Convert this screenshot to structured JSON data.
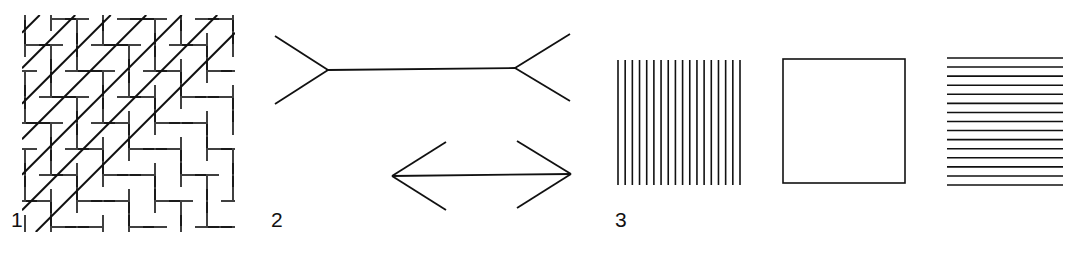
{
  "plate": {
    "width": 1074,
    "height": 279,
    "background_color": "#ffffff",
    "ink_color": "#111111"
  },
  "figures": [
    {
      "id": "zollner",
      "label": "1",
      "title": "Zollner illusion",
      "description": "Square field of parallel diagonal lines crossed by short herringbone hatch strokes",
      "geometry": {
        "box": {
          "x": 22,
          "y": 15,
          "width": 213,
          "height": 217
        },
        "main_line_count": 6,
        "main_line_angle_deg": -45,
        "main_line_width": 2.0,
        "hatch_stroke_width": 1.6,
        "hatch_length": 24,
        "hatch_row_spacing": 13,
        "hatch_angle_a_deg": 90,
        "hatch_angle_b_deg": 0
      }
    },
    {
      "id": "muller-lyer",
      "label": "2",
      "title": "Muller-Lyer illusion",
      "description": "Two equal horizontal shafts, one with outward fins and one with inward arrowheads",
      "geometry": {
        "stroke_width": 1.8,
        "outward": {
          "shaft": {
            "x1": 328,
            "y1": 70,
            "x2": 515,
            "y2": 68
          },
          "fins": [
            {
              "x1": 328,
              "y1": 70,
              "x2": 275,
              "y2": 36
            },
            {
              "x1": 328,
              "y1": 70,
              "x2": 275,
              "y2": 104
            },
            {
              "x1": 515,
              "y1": 68,
              "x2": 570,
              "y2": 34
            },
            {
              "x1": 515,
              "y1": 68,
              "x2": 570,
              "y2": 101
            }
          ]
        },
        "inward": {
          "shaft": {
            "x1": 392,
            "y1": 176,
            "x2": 571,
            "y2": 174
          },
          "fins": [
            {
              "x1": 392,
              "y1": 176,
              "x2": 446,
              "y2": 142
            },
            {
              "x1": 392,
              "y1": 176,
              "x2": 446,
              "y2": 210
            },
            {
              "x1": 571,
              "y1": 174,
              "x2": 517,
              "y2": 141
            },
            {
              "x1": 571,
              "y1": 174,
              "x2": 517,
              "y2": 208
            }
          ]
        }
      }
    },
    {
      "id": "helmholtz-squares",
      "label": "3",
      "title": "Helmholtz square illusion",
      "description": "A square filled with vertical stripes, an empty outline square, and a square filled with horizontal stripes",
      "geometry": {
        "stroke_width": 1.6,
        "vertical_striped_square": {
          "x": 618,
          "y": 60,
          "width": 122,
          "height": 125,
          "line_count": 18,
          "orientation": "vertical"
        },
        "outline_square": {
          "x": 783,
          "y": 59,
          "width": 122,
          "height": 124,
          "orientation": "none"
        },
        "horizontal_striped_square": {
          "x": 947,
          "y": 58,
          "width": 116,
          "height": 127,
          "line_count": 15,
          "orientation": "horizontal"
        }
      }
    }
  ]
}
